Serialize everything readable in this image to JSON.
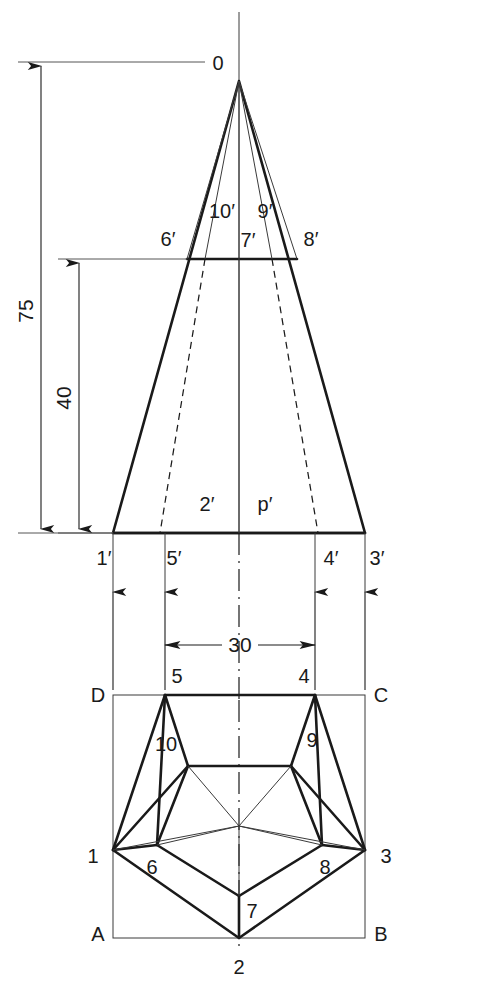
{
  "drawing": {
    "title": "Pentagonal pyramid — front view (elevation) and top view (plan) orthographic projection",
    "background_color": "#ffffff",
    "line_color": "#1a1a1a",
    "dimensions": [
      {
        "id": "height-total",
        "value": "75",
        "orientation": "vertical",
        "note": "overall height of pyramid apex above base"
      },
      {
        "id": "height-partial",
        "value": "40",
        "orientation": "vertical",
        "note": "height of section level 6'-7'-8' above base"
      },
      {
        "id": "width-span",
        "value": "30",
        "orientation": "horizontal",
        "note": "distance between projectors 5'/5 and 4'/4"
      }
    ],
    "front_view": {
      "name": "front-view",
      "apex_label": "0",
      "labels": [
        {
          "text": "0",
          "id": "apex-o"
        },
        {
          "text": "10′",
          "id": "fv-10p"
        },
        {
          "text": "9′",
          "id": "fv-9p"
        },
        {
          "text": "6′",
          "id": "fv-6p"
        },
        {
          "text": "7′",
          "id": "fv-7p"
        },
        {
          "text": "8′",
          "id": "fv-8p"
        },
        {
          "text": "2′",
          "id": "fv-2p"
        },
        {
          "text": "p′",
          "id": "fv-pp"
        },
        {
          "text": "1′",
          "id": "fv-1p"
        },
        {
          "text": "5′",
          "id": "fv-5p"
        },
        {
          "text": "4′",
          "id": "fv-4p"
        },
        {
          "text": "3′",
          "id": "fv-3p"
        }
      ]
    },
    "top_view": {
      "name": "top-view",
      "labels": [
        {
          "text": "D",
          "id": "tv-D"
        },
        {
          "text": "C",
          "id": "tv-C"
        },
        {
          "text": "A",
          "id": "tv-A"
        },
        {
          "text": "B",
          "id": "tv-B"
        },
        {
          "text": "5",
          "id": "tv-5"
        },
        {
          "text": "4",
          "id": "tv-4"
        },
        {
          "text": "10",
          "id": "tv-10"
        },
        {
          "text": "9",
          "id": "tv-9"
        },
        {
          "text": "1",
          "id": "tv-1"
        },
        {
          "text": "3",
          "id": "tv-3"
        },
        {
          "text": "6",
          "id": "tv-6"
        },
        {
          "text": "8",
          "id": "tv-8"
        },
        {
          "text": "7",
          "id": "tv-7"
        },
        {
          "text": "2",
          "id": "tv-2"
        }
      ]
    }
  }
}
